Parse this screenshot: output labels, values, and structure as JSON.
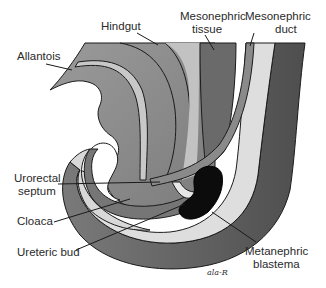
{
  "figure": {
    "labels": {
      "allantois": "Allantois",
      "hindgut": "Hindgut",
      "mesonephric_tissue_1": "Mesonephric",
      "mesonephric_tissue_2": "tissue",
      "mesonephric_duct_1": "Mesonephric",
      "mesonephric_duct_2": "duct",
      "urorectal_septum_1": "Urorectal",
      "urorectal_septum_2": "septum",
      "cloaca": "Cloaca",
      "ureteric_bud": "Ureteric bud",
      "metanephric_blastema_1": "Metanephric",
      "metanephric_blastema_2": "blastema"
    },
    "signature": "ala-R",
    "colors": {
      "outer_dark": "#5e5e5e",
      "mid_gray": "#8c8c8c",
      "light_gray": "#c4c4c4",
      "pale": "#dcdcdc",
      "mesonephric_tissue": "#6e6e6e",
      "duct": "#8a8a8a",
      "blastema": "#0c0c0c",
      "outline": "#1a1a1a",
      "background": "#ffffff"
    }
  }
}
